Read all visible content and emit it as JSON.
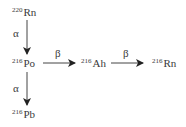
{
  "diagram": {
    "nodes": [
      {
        "id": "rn220",
        "mass": "220",
        "symbol": "Rn"
      },
      {
        "id": "po216",
        "mass": "216",
        "symbol": "Po"
      },
      {
        "id": "ah216",
        "mass": "216",
        "symbol": "Ah"
      },
      {
        "id": "rn216",
        "mass": "216",
        "symbol": "Rn"
      },
      {
        "id": "pb216",
        "mass": "216",
        "symbol": "Pb"
      }
    ],
    "edges": [
      {
        "from": "rn220",
        "to": "po216",
        "label": "α"
      },
      {
        "from": "po216",
        "to": "ah216",
        "label": "β"
      },
      {
        "from": "ah216",
        "to": "rn216",
        "label": "β"
      },
      {
        "from": "po216",
        "to": "pb216",
        "label": "α"
      }
    ]
  },
  "colors": {
    "ink": "#3a3a3a",
    "arrow": "#222222"
  }
}
